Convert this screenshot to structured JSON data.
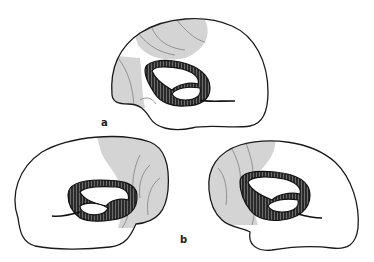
{
  "figure": {
    "panels": [
      {
        "id": "a",
        "label": "a",
        "shaded_region": "superior-anterior and frontal pole"
      },
      {
        "id": "b",
        "label": "b",
        "views": [
          {
            "position": "left",
            "shaded_region": "posterior (parietal/occipital)"
          },
          {
            "position": "right",
            "shaded_region": "anterior (frontal)"
          }
        ]
      }
    ],
    "colors": {
      "background": "#ffffff",
      "outline": "#1a1a1a",
      "shading": "#d4d4d4",
      "limbic_ring": "#2a2a2a"
    }
  }
}
